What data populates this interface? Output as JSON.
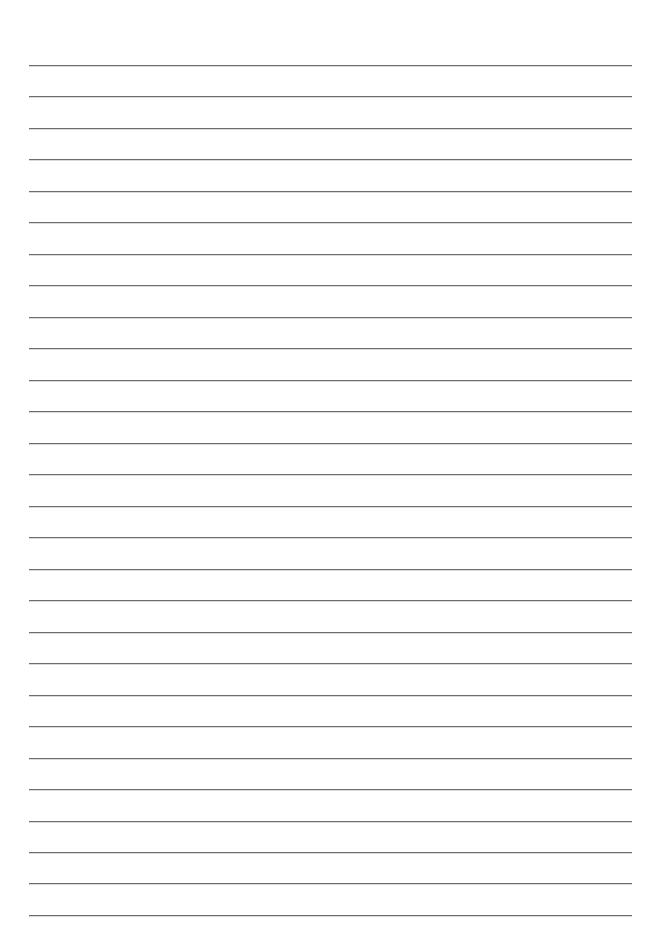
{
  "document": {
    "type": "lined-paper",
    "line_count": 28,
    "first_line_y": 65,
    "line_spacing": 31.48,
    "line_left": 29,
    "line_right": 632,
    "colors": {
      "paper": "#ffffff",
      "rule": "#6e6e6e"
    },
    "text": []
  }
}
